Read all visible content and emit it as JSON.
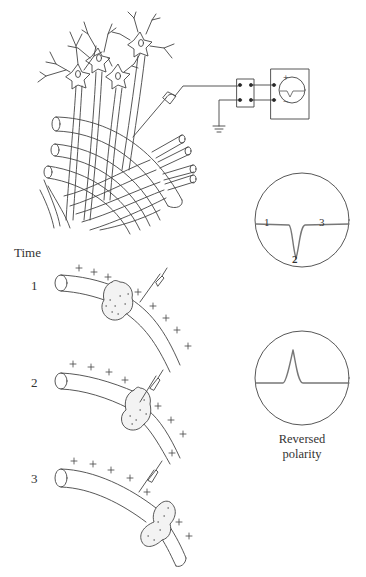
{
  "labels": {
    "time_heading": "Time",
    "step_1": "1",
    "step_2": "2",
    "step_3": "3",
    "caption_line1": "Reversed",
    "caption_line2": "polarity"
  },
  "oscilloscope_trace": {
    "point_1": "1",
    "point_2": "2",
    "point_3": "3"
  },
  "meter": {
    "plus": "+",
    "minus": "−"
  },
  "colors": {
    "line": "#444444",
    "trace": "#777777",
    "background": "#ffffff"
  }
}
